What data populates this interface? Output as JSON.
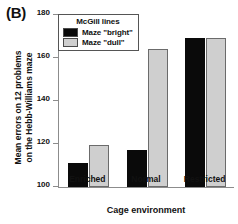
{
  "panel": {
    "label": "(B)"
  },
  "legend": {
    "title": "McGill lines",
    "entries": [
      {
        "label": "Maze \"bright\"",
        "color": "#0a0a0a"
      },
      {
        "label": "Maze \"dull\"",
        "color": "#cfcfcf"
      }
    ]
  },
  "axes": {
    "ylabel_line1": "Mean errors on 12 problems",
    "ylabel_line2": "on the Hebb-Williams maze",
    "xlabel": "Cage environment",
    "yticks": [
      100,
      120,
      140,
      160,
      180
    ]
  },
  "chart_data": {
    "type": "bar",
    "title": "(B)",
    "categories": [
      "Enriched",
      "Normal",
      "Restricted"
    ],
    "series": [
      {
        "name": "Maze \"bright\"",
        "color": "#0a0a0a",
        "values": [
          111,
          117,
          169.5
        ]
      },
      {
        "name": "Maze \"dull\"",
        "color": "#cfcfcf",
        "values": [
          119.5,
          164,
          169.5
        ]
      }
    ],
    "xlabel": "Cage environment",
    "ylabel": "Mean errors on 12 problems on the Hebb-Williams maze",
    "ylim": [
      100,
      180
    ],
    "ytick_step": 20,
    "grid": false,
    "legend_title": "McGill lines",
    "legend_position": "top-left-inside"
  }
}
